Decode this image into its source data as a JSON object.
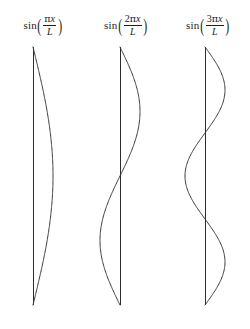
{
  "figure": {
    "background_color": "#ffffff",
    "stroke_color": "#3a3a3a",
    "axis_color": "#2b2b2b"
  },
  "panels": [
    {
      "id": "mode-1",
      "label_plain": "sin(πx/L)",
      "function_name": "sin",
      "open_paren": "(",
      "close_paren": ")",
      "numerator_coefficient": "",
      "numerator_pi": "π",
      "numerator_variable": "x",
      "denominator": "L",
      "axis_x": 33,
      "half_periods": 1
    },
    {
      "id": "mode-2",
      "label_plain": "sin(2πx/L)",
      "function_name": "sin",
      "open_paren": "(",
      "close_paren": ")",
      "numerator_coefficient": "2",
      "numerator_pi": "π",
      "numerator_variable": "x",
      "denominator": "L",
      "axis_x": 120,
      "half_periods": 2
    },
    {
      "id": "mode-3",
      "label_plain": "sin(3πx/L)",
      "function_name": "sin",
      "open_paren": "(",
      "close_paren": ")",
      "numerator_coefficient": "3",
      "numerator_pi": "π",
      "numerator_variable": "x",
      "denominator": "L",
      "axis_x": 205,
      "half_periods": 3
    }
  ],
  "chart_data": {
    "type": "line",
    "title": "",
    "xlabel": "",
    "ylabel": "",
    "axis_top_y": 47,
    "axis_bottom_y": 305,
    "amplitude_px": 20,
    "grid": false,
    "legend": "none",
    "series": [
      {
        "name": "sin(πx/L)",
        "axis_x": 33,
        "half_periods": 1,
        "nodes_y": [
          47,
          305
        ],
        "antinodes": [
          {
            "y": 176,
            "direction": "right"
          }
        ]
      },
      {
        "name": "sin(2πx/L)",
        "axis_x": 120,
        "half_periods": 2,
        "nodes_y": [
          47,
          176,
          305
        ],
        "antinodes": [
          {
            "y": 111,
            "direction": "right"
          },
          {
            "y": 240,
            "direction": "left"
          }
        ]
      },
      {
        "name": "sin(3πx/L)",
        "axis_x": 205,
        "half_periods": 3,
        "nodes_y": [
          47,
          133,
          219,
          305
        ],
        "antinodes": [
          {
            "y": 90,
            "direction": "right"
          },
          {
            "y": 176,
            "direction": "left"
          },
          {
            "y": 262,
            "direction": "right"
          }
        ]
      }
    ]
  }
}
